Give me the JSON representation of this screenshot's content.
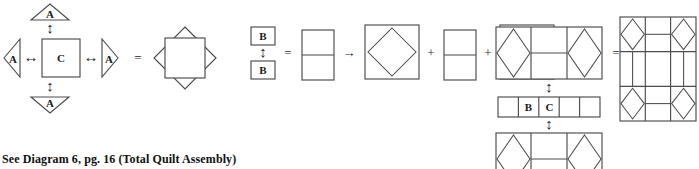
{
  "caption": "See Diagram 6, pg. 16 (Total Quilt Assembly)",
  "symbols": {
    "equals": "=",
    "plus": "+",
    "arrow_right": "→",
    "arrow_lr": "↔",
    "arrow_ud": "↕"
  },
  "group_a": {
    "name": "center-block-assembly",
    "center_label": "C",
    "triangle_top_label": "A",
    "triangle_bottom_label": "A",
    "triangle_left_label": "A",
    "triangle_right_label": "A",
    "equals": "=",
    "result_name": "square-in-square-block"
  },
  "group_b": {
    "name": "side-unit-assembly",
    "top_label": "B",
    "bottom_label": "B",
    "equals": "=",
    "arrow_right": "→",
    "terms": [
      {
        "name": "square-in-square-block"
      },
      {
        "name": "two-patch-rectangle"
      },
      {
        "name": "square-in-square-block"
      }
    ],
    "plus": "+",
    "result_name": "three-unit-row"
  },
  "group_c": {
    "name": "rows-assembly",
    "row_top_name": "three-unit-row",
    "row_middle_cells": [
      "",
      "B",
      "C",
      "",
      ""
    ],
    "row_bottom_name": "three-unit-row",
    "arrow_ud": "↕",
    "equals": "="
  },
  "quilt": {
    "name": "total-quilt",
    "rows": 3,
    "cols": 3,
    "corner_block": "square-in-square-block",
    "edge_block": "two-patch-rectangle",
    "center_block": "plain-square"
  },
  "colors": {
    "line": "#4c4c4c",
    "text": "#1a1a1a",
    "background": "#ffffff"
  }
}
